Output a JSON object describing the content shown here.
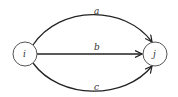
{
  "diagram": {
    "type": "directed-multigraph",
    "nodes": [
      {
        "id": "i",
        "label": "i"
      },
      {
        "id": "j",
        "label": "j"
      }
    ],
    "edges": [
      {
        "id": "a",
        "label": "a",
        "from": "i",
        "to": "j",
        "shape": "arc-upper"
      },
      {
        "id": "b",
        "label": "b",
        "from": "i",
        "to": "j",
        "shape": "straight"
      },
      {
        "id": "c",
        "label": "c",
        "from": "i",
        "to": "j",
        "shape": "arc-lower"
      }
    ],
    "colors": {
      "stroke": "#222222",
      "node_stroke": "#555555",
      "background": "#ffffff"
    }
  }
}
